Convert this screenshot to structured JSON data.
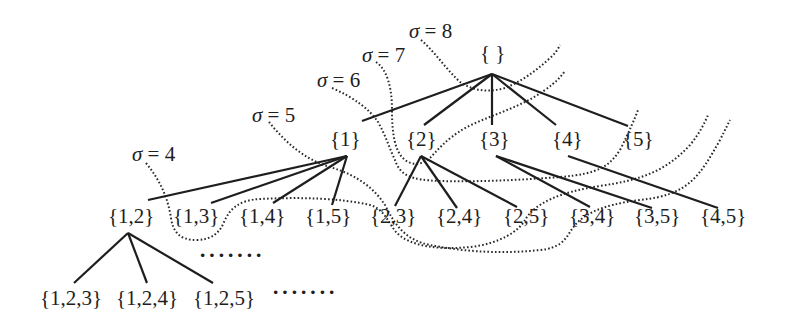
{
  "diagram": {
    "nodes": {
      "root": "{ }",
      "level1": [
        "{1}",
        "{2}",
        "{3}",
        "{4}",
        "{5}"
      ],
      "level2": [
        "{1,2}",
        "{1,3}",
        "{1,4}",
        "{1,5}",
        "{2,3}",
        "{2,4}",
        "{2,5}",
        "{3,4}",
        "{3,5}",
        "{4,5}"
      ],
      "level3": [
        "{1,2,3}",
        "{1,2,4}",
        "{1,2,5}"
      ]
    },
    "ellipsis": {
      "mid": "·······",
      "bottom": "·······"
    },
    "sigma_labels": [
      {
        "symbol": "σ",
        "text": " = 4"
      },
      {
        "symbol": "σ",
        "text": " = 5"
      },
      {
        "symbol": "σ",
        "text": " = 6"
      },
      {
        "symbol": "σ",
        "text": " = 7"
      },
      {
        "symbol": "σ",
        "text": " = 8"
      }
    ],
    "edges": [
      [
        "{ }",
        "{1}"
      ],
      [
        "{ }",
        "{2}"
      ],
      [
        "{ }",
        "{3}"
      ],
      [
        "{ }",
        "{4}"
      ],
      [
        "{ }",
        "{5}"
      ],
      [
        "{1}",
        "{1,2}"
      ],
      [
        "{1}",
        "{1,3}"
      ],
      [
        "{1}",
        "{1,4}"
      ],
      [
        "{1}",
        "{1,5}"
      ],
      [
        "{2}",
        "{2,3}"
      ],
      [
        "{2}",
        "{2,4}"
      ],
      [
        "{2}",
        "{2,5}"
      ],
      [
        "{3}",
        "{3,4}"
      ],
      [
        "{3}",
        "{3,5}"
      ],
      [
        "{4}",
        "{4,5}"
      ],
      [
        "{1,2}",
        "{1,2,3}"
      ],
      [
        "{1,2}",
        "{1,2,4}"
      ],
      [
        "{1,2}",
        "{1,2,5}"
      ]
    ],
    "colors": {
      "ink": "#1e1e1e",
      "background": "#ffffff"
    }
  }
}
